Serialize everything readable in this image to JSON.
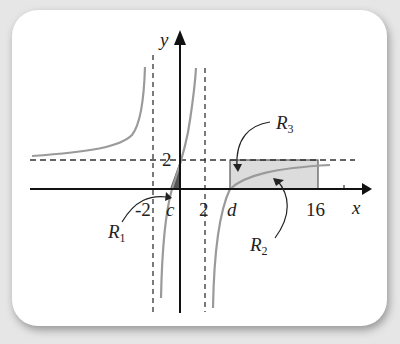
{
  "figure": {
    "axis_labels": {
      "x": "x",
      "y": "y"
    },
    "tick_labels": {
      "neg_two": "-2",
      "two": "2",
      "c": "c",
      "d": "d",
      "sixteen": "16",
      "y_two": "2"
    },
    "regions": {
      "r1": {
        "letter": "R",
        "sub": "1"
      },
      "r2": {
        "letter": "R",
        "sub": "2"
      },
      "r3": {
        "letter": "R",
        "sub": "3"
      }
    },
    "asymptotes": {
      "vertical": [
        -2,
        2
      ],
      "horizontal": 2
    },
    "colors": {
      "curve": "#9a9a9a",
      "axis": "#111111",
      "shade_light": "#dcdcdc",
      "shade_dark": "#555555"
    }
  }
}
